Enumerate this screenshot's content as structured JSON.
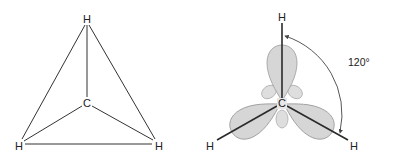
{
  "figure": {
    "left_panel": {
      "title": "tetrahedral-projection",
      "atoms": [
        {
          "id": "h_top",
          "label": "H",
          "x": 87,
          "y": 19
        },
        {
          "id": "c_center",
          "label": "C",
          "x": 87,
          "y": 103
        },
        {
          "id": "h_bottom_left",
          "label": "H",
          "x": 19,
          "y": 146
        },
        {
          "id": "h_bottom_right",
          "label": "H",
          "x": 158,
          "y": 146
        }
      ]
    },
    "right_panel": {
      "title": "trigonal-planar-orbitals",
      "atoms": [
        {
          "id": "h_top",
          "label": "H",
          "x": 282,
          "y": 17
        },
        {
          "id": "c_center",
          "label": "C",
          "x": 282,
          "y": 103
        },
        {
          "id": "h_bottom_left",
          "label": "H",
          "x": 211,
          "y": 146
        },
        {
          "id": "h_bottom_right",
          "label": "H",
          "x": 354,
          "y": 146
        }
      ],
      "angle_label": "120°"
    },
    "colors": {
      "lobe_fill": "#d6d6d6",
      "lobe_stroke": "#9a9a9a",
      "line": "#333333",
      "background": "#ffffff"
    }
  }
}
